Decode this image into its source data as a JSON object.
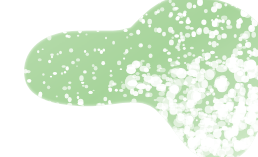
{
  "image": {
    "title": "Abstract organic green blob",
    "alt_text": "A speckled light-green peanut-shaped blob on a white background",
    "width": 258,
    "height": 157,
    "background_color": "#ffffff"
  },
  "palette": {
    "background": "#ffffff",
    "green_base": "#a7d49b",
    "green_mid": "#b8dcae",
    "green_light": "#cde8c6",
    "green_pale": "#e2f1dd",
    "speckle": "#ffffff"
  },
  "shape": {
    "name": "two-lobed-blob",
    "description": "Peanut / kidney silhouette: a small rounded left lobe joined by a narrow saddle to a larger right lobe that runs off the right edge and trails into the bottom-right corner.",
    "lobes": [
      {
        "name": "left-lobe",
        "center_x": 78,
        "center_y": 68,
        "radius_x": 56,
        "radius_y": 38
      },
      {
        "name": "right-lobe",
        "center_x": 196,
        "center_y": 62,
        "radius_x": 72,
        "radius_y": 60
      }
    ],
    "outline_path": "M 24,72 C 24,48 44,33 72,31 C 100,29 116,33 131,27 C 146,12 160,-4 186,-4 C 222,-4 262,10 272,50 C 280,84 266,120 250,146 C 236,168 204,166 186,146 C 172,130 164,114 150,106 C 134,97 108,108 78,106 C 44,104 24,94 24,72 Z"
  },
  "texture": {
    "name": "stipple-speckle",
    "description": "Dense scattering of small white speckles over the green fill; speckle size and coverage increase toward the bottom-right so the mass dissolves into a maze-like lattice.",
    "dot_count": 1500,
    "dot_min_size": 1.0,
    "dot_max_size": 3.6,
    "edge_softness_px": 3
  },
  "gradient_stops": [
    {
      "offset": "0%",
      "color": "#b9ddaf"
    },
    {
      "offset": "45%",
      "color": "#a7d49b"
    },
    {
      "offset": "78%",
      "color": "#bfe0b6"
    },
    {
      "offset": "100%",
      "color": "#dcefd6"
    }
  ],
  "regions": [
    {
      "name": "top-left-white",
      "note": "empty white corner above the left lobe"
    },
    {
      "name": "left-lobe-dense",
      "note": "solid green with fine white stipple"
    },
    {
      "name": "saddle-notch",
      "note": "concave white wedge under the join of the two lobes"
    },
    {
      "name": "right-lobe-dense",
      "note": "largest green mass, reaches the top and right edges"
    },
    {
      "name": "bottom-right-dissolve",
      "note": "inverted lattice where white dominates and green survives as thin strands"
    },
    {
      "name": "bottom-left-white",
      "note": "empty white area below the left lobe"
    }
  ]
}
